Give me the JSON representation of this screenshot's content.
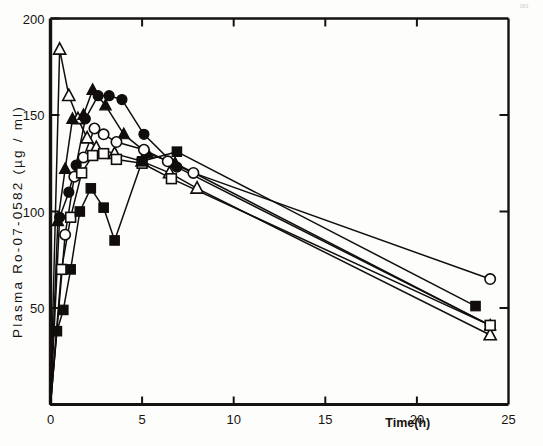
{
  "figure": {
    "corner_note": "383",
    "background_color": "#fdfdfb",
    "ink_color": "#100d0a"
  },
  "chart_data": {
    "type": "line",
    "title": "",
    "subtitle": "",
    "xlabel": "Time(h)",
    "ylabel": "Plasma  Ro-07-0582  (µg / ml)",
    "ylabel_parts": {
      "prefix": "Plasma",
      "compound": "Ro-07-0582",
      "units": "(µg / ml)"
    },
    "xlim": [
      0,
      25
    ],
    "ylim": [
      0,
      200
    ],
    "xticks": [
      0,
      5,
      10,
      15,
      20,
      25
    ],
    "xtick_labels": [
      "0",
      "5",
      "10",
      "15",
      "20",
      "25"
    ],
    "yticks": [
      50,
      100,
      150,
      200
    ],
    "ytick_labels": [
      "50",
      "100",
      "150",
      "200"
    ],
    "grid": false,
    "legend": "none",
    "legend_position": "none",
    "frame": "box",
    "series": [
      {
        "name": "Subject 1",
        "marker": "open-triangle",
        "marker_fill": "open",
        "marker_shape": "triangle",
        "x": [
          0,
          0.5,
          1.0,
          1.5,
          2.0,
          2.5,
          3.5,
          5.0,
          6.5,
          8.0,
          24.0
        ],
        "y": [
          0,
          184,
          160,
          148,
          138,
          133,
          130,
          126,
          120,
          112,
          36
        ]
      },
      {
        "name": "Subject 2",
        "marker": "filled-triangle",
        "marker_fill": "filled",
        "marker_shape": "triangle",
        "x": [
          0,
          0.4,
          0.8,
          1.2,
          1.8,
          2.3,
          3.0,
          4.0,
          5.3,
          6.8,
          24.0
        ],
        "y": [
          0,
          95,
          122,
          148,
          150,
          163,
          155,
          140,
          130,
          125,
          41
        ]
      },
      {
        "name": "Subject 3",
        "marker": "filled-circle",
        "marker_fill": "filled",
        "marker_shape": "circle",
        "x": [
          0,
          0.5,
          1.0,
          1.4,
          1.9,
          2.6,
          3.2,
          3.9,
          5.1,
          6.9,
          24.0
        ],
        "y": [
          0,
          97,
          110,
          124,
          148,
          160,
          160,
          158,
          140,
          123,
          41
        ]
      },
      {
        "name": "Subject 4",
        "marker": "open-circle",
        "marker_fill": "open",
        "marker_shape": "circle",
        "x": [
          0,
          0.8,
          1.3,
          1.8,
          2.4,
          2.9,
          3.6,
          5.1,
          6.4,
          7.8,
          24.0
        ],
        "y": [
          0,
          88,
          118,
          128,
          143,
          140,
          136,
          132,
          126,
          120,
          65
        ]
      },
      {
        "name": "Subject 5",
        "marker": "open-square",
        "marker_fill": "open",
        "marker_shape": "square",
        "x": [
          0,
          0.6,
          1.1,
          1.7,
          2.3,
          2.9,
          3.6,
          5.0,
          6.6,
          24.0
        ],
        "y": [
          0,
          70,
          97,
          120,
          129,
          130,
          127,
          125,
          117,
          41
        ]
      },
      {
        "name": "Subject 6",
        "marker": "filled-square",
        "marker_fill": "filled",
        "marker_shape": "square",
        "x": [
          0,
          0.35,
          0.7,
          1.1,
          1.6,
          2.2,
          2.9,
          3.5,
          5.0,
          6.9,
          23.2
        ],
        "y": [
          0,
          38,
          49,
          70,
          100,
          112,
          102,
          85,
          126,
          131,
          51
        ]
      }
    ]
  }
}
